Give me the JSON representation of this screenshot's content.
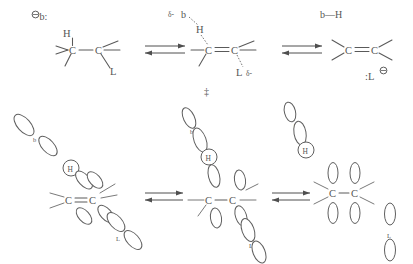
{
  "figure": {
    "accent_color": "#555555",
    "background": "#ffffff"
  },
  "top_row": {
    "reactants": {
      "base_label": "b:",
      "base_charge": "⊖",
      "hydrogen_label": "H",
      "carbon_left": "C",
      "carbon_right": "C",
      "leaving_group_label": "L"
    },
    "transition_state": {
      "delta_base": "δ-",
      "base_label": "b",
      "hydrogen_label": "H",
      "carbon_left": "C",
      "carbon_right": "C",
      "leaving_group_label": "L",
      "delta_leaving": "δ-",
      "dagger": "‡"
    },
    "products": {
      "conjugate_acid": "b—H",
      "carbon_left": "C",
      "carbon_right": "C",
      "leaving_group_label": ":L",
      "leaving_group_charge": "⊖"
    },
    "arrow_one": "equilibrium-arrow",
    "arrow_two": "equilibrium-arrow"
  },
  "bottom_row": {
    "reactants_orbitals": {
      "base_label": "b",
      "hydrogen_label": "H",
      "carbon_left": "C",
      "carbon_right": "C",
      "leaving_group_label": "L"
    },
    "transition_state_orbitals": {
      "base_label": "b",
      "hydrogen_label": "H",
      "carbon_left": "C",
      "carbon_right": "C",
      "leaving_group_label": "L"
    },
    "products_orbitals": {
      "base_label": "b",
      "hydrogen_label": "H",
      "carbon_left": "C",
      "carbon_right": "C",
      "leaving_group_label": "L"
    },
    "arrow_one": "equilibrium-arrow",
    "arrow_two": "equilibrium-arrow"
  }
}
